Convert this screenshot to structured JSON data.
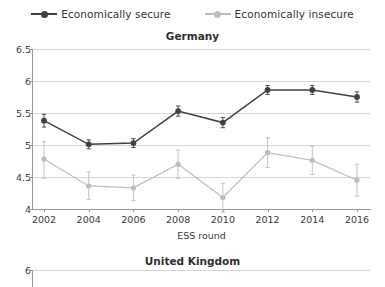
{
  "legend": {
    "entries": [
      {
        "label": "Economically secure",
        "color": "#404040",
        "marker": "filled-circle-marker"
      },
      {
        "label": "Economically insecure",
        "color": "#bdbdbd",
        "marker": "filled-circle-marker"
      }
    ]
  },
  "panels": [
    {
      "title": "Germany"
    },
    {
      "title": "United Kingdom"
    }
  ],
  "axes": {
    "x_title": "ESS round",
    "x_ticks": [
      "2002",
      "2004",
      "2006",
      "2008",
      "2010",
      "2012",
      "2014",
      "2016"
    ],
    "y_ticks_germany": [
      "6.5",
      "6",
      "5.5",
      "5",
      "4.5",
      "4"
    ],
    "y_ticks_uk": [
      "6"
    ]
  },
  "chart_data": {
    "type": "line",
    "title": "Germany",
    "xlabel": "ESS round",
    "ylabel": "",
    "x": [
      2002,
      2004,
      2006,
      2008,
      2010,
      2012,
      2014,
      2016
    ],
    "categories": [
      "2002",
      "2004",
      "2006",
      "2008",
      "2010",
      "2012",
      "2014",
      "2016"
    ],
    "ylim": [
      4,
      6.5
    ],
    "yticks": [
      4,
      4.5,
      5,
      5.5,
      6,
      6.5
    ],
    "grid": true,
    "legend_position": "top-center",
    "error_bars": true,
    "series": [
      {
        "name": "Economically secure",
        "color": "#404040",
        "values": [
          5.38,
          5.01,
          5.03,
          5.53,
          5.35,
          5.86,
          5.86,
          5.75
        ],
        "err_low": [
          5.28,
          4.94,
          4.96,
          5.45,
          5.27,
          5.79,
          5.79,
          5.67
        ],
        "err_high": [
          5.48,
          5.08,
          5.1,
          5.61,
          5.43,
          5.93,
          5.93,
          5.83
        ]
      },
      {
        "name": "Economically insecure",
        "color": "#bdbdbd",
        "values": [
          4.78,
          4.36,
          4.33,
          4.7,
          4.18,
          4.88,
          4.76,
          4.45
        ],
        "err_low": [
          4.48,
          4.15,
          4.13,
          4.48,
          3.95,
          4.65,
          4.54,
          4.2
        ],
        "err_high": [
          5.05,
          4.58,
          4.53,
          4.92,
          4.4,
          5.11,
          4.98,
          4.7
        ]
      }
    ],
    "second_panel": {
      "title": "United Kingdom",
      "yticks_visible": [
        6
      ],
      "note": "panel cropped at image bottom edge"
    }
  }
}
